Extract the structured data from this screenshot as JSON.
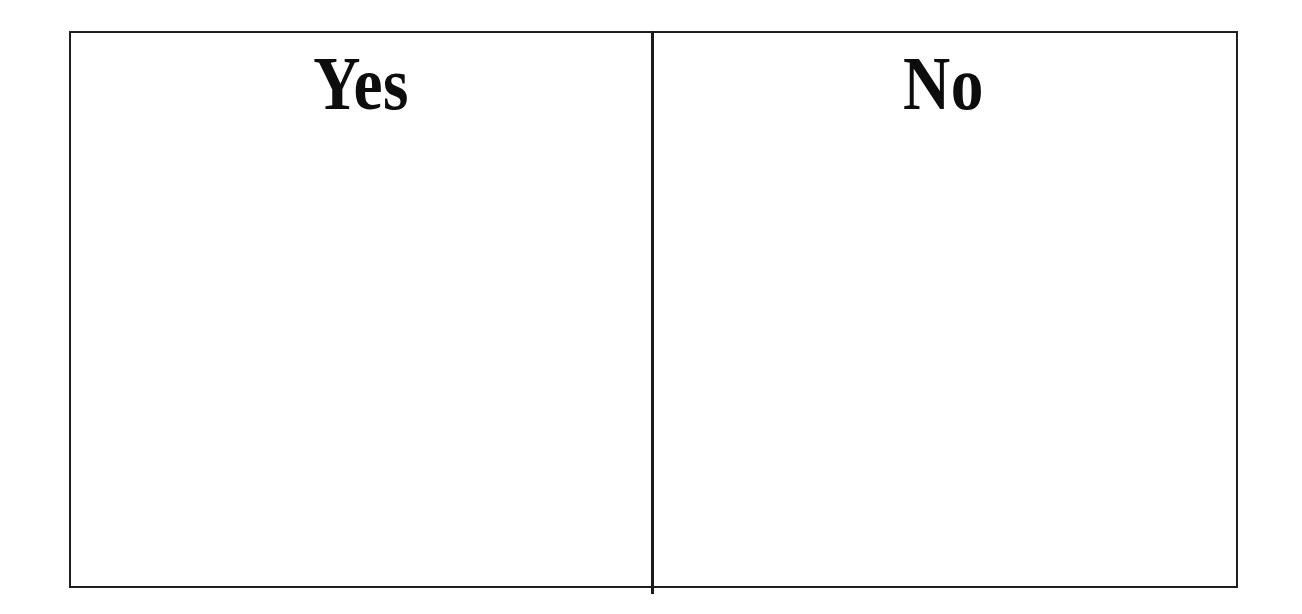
{
  "document": {
    "background_color": "#ffffff",
    "ink_color": "#1b1b1b"
  },
  "table": {
    "border_color": "#1b1b1b",
    "columns": [
      {
        "id": "yes",
        "header": "Yes",
        "body_text": ""
      },
      {
        "id": "no",
        "header": "No",
        "body_text": ""
      }
    ]
  }
}
